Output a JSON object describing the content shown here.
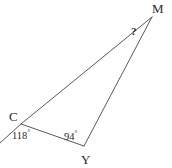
{
  "figure": {
    "shape": "triangle",
    "stroke_color": "#5a5a5e",
    "background_color": "#fefefe",
    "text_color": "#2b2b2b",
    "vertices": [
      {
        "name": "M",
        "label": "M",
        "x": 152,
        "y": 17
      },
      {
        "name": "C",
        "label": "C",
        "x": 21,
        "y": 124
      },
      {
        "name": "Y",
        "label": "Y",
        "x": 84,
        "y": 146
      }
    ],
    "edges": [
      {
        "name": "segment-CM",
        "from": "C",
        "to": "M"
      },
      {
        "name": "segment-MY",
        "from": "M",
        "to": "Y"
      },
      {
        "name": "segment-CY",
        "from": "C",
        "to": "Y"
      }
    ],
    "extension_ray": {
      "name": "ray-beyond-C",
      "from": "C",
      "to_x": 0,
      "to_y": 143
    },
    "angles": [
      {
        "name": "angle-at-C",
        "vertex": "C",
        "value": "118",
        "degree_symbol": "°",
        "type": "exterior"
      },
      {
        "name": "angle-at-Y",
        "vertex": "Y",
        "value": "94",
        "degree_symbol": "°",
        "type": "interior"
      },
      {
        "name": "angle-at-M",
        "vertex": "M",
        "value": "?",
        "degree_symbol": "",
        "type": "unknown"
      }
    ]
  }
}
